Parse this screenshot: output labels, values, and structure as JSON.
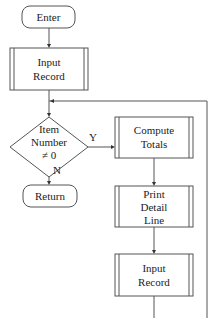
{
  "diagram": {
    "type": "flowchart",
    "nodes": {
      "enter": {
        "kind": "terminator",
        "lines": [
          "Enter"
        ]
      },
      "input_record_1": {
        "kind": "predefined-process",
        "lines": [
          "Input",
          "Record"
        ]
      },
      "decision": {
        "kind": "decision",
        "lines": [
          "Item",
          "Number",
          "≠ 0"
        ]
      },
      "return": {
        "kind": "terminator",
        "lines": [
          "Return"
        ]
      },
      "compute_totals": {
        "kind": "predefined-process",
        "lines": [
          "Compute",
          "Totals"
        ]
      },
      "print_detail_line": {
        "kind": "predefined-process",
        "lines": [
          "Print",
          "Detail",
          "Line"
        ]
      },
      "input_record_2": {
        "kind": "predefined-process",
        "lines": [
          "Input",
          "Record"
        ]
      }
    },
    "edge_labels": {
      "yes": "Y",
      "no": "N"
    },
    "edges": [
      {
        "from": "enter",
        "to": "input_record_1"
      },
      {
        "from": "input_record_1",
        "to": "decision"
      },
      {
        "from": "decision",
        "to": "compute_totals",
        "label": "Y"
      },
      {
        "from": "decision",
        "to": "return",
        "label": "N"
      },
      {
        "from": "compute_totals",
        "to": "print_detail_line"
      },
      {
        "from": "print_detail_line",
        "to": "input_record_2"
      },
      {
        "from": "input_record_2",
        "to": "decision",
        "kind": "loop-back"
      }
    ]
  }
}
